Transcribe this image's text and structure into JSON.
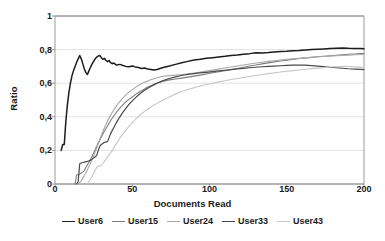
{
  "chart_data": {
    "type": "line",
    "title": "",
    "xlabel": "Documents Read",
    "ylabel": "Ratio",
    "xlim": [
      0,
      200
    ],
    "ylim": [
      0,
      1
    ],
    "xticks": [
      "0",
      "50",
      "100",
      "150",
      "200"
    ],
    "xtick_values": [
      0,
      50,
      100,
      150,
      200
    ],
    "yticks": [
      "0",
      "0,2",
      "0,4",
      "0,6",
      "0,8",
      "1"
    ],
    "ytick_values": [
      0,
      0.2,
      0.4,
      0.6,
      0.8,
      1
    ],
    "grid": "horizontal",
    "legend_position": "bottom",
    "decimal_separator": ",",
    "series": [
      {
        "name": "User6",
        "color": "#1c1c1c",
        "width": 1.5,
        "x": [
          4,
          5,
          6,
          7,
          8,
          9,
          10,
          11,
          12,
          13,
          14,
          15,
          16,
          17,
          18,
          19,
          20,
          21,
          22,
          23,
          24,
          25,
          26,
          27,
          28,
          29,
          30,
          31,
          32,
          33,
          34,
          35,
          36,
          37,
          38,
          39,
          40,
          42,
          44,
          46,
          48,
          50,
          52,
          54,
          56,
          58,
          60,
          62,
          64,
          66,
          68,
          70,
          74,
          78,
          82,
          86,
          90,
          94,
          98,
          102,
          106,
          110,
          114,
          118,
          122,
          126,
          130,
          134,
          138,
          142,
          146,
          150,
          154,
          158,
          162,
          166,
          170,
          174,
          178,
          182,
          186,
          190,
          194,
          198,
          200
        ],
        "y": [
          0.2,
          0.235,
          0.235,
          0.37,
          0.47,
          0.545,
          0.6,
          0.645,
          0.675,
          0.7,
          0.725,
          0.745,
          0.765,
          0.745,
          0.715,
          0.685,
          0.663,
          0.652,
          0.675,
          0.695,
          0.715,
          0.73,
          0.745,
          0.755,
          0.762,
          0.765,
          0.752,
          0.742,
          0.748,
          0.735,
          0.728,
          0.735,
          0.722,
          0.716,
          0.72,
          0.713,
          0.708,
          0.712,
          0.705,
          0.7,
          0.698,
          0.702,
          0.697,
          0.693,
          0.688,
          0.69,
          0.685,
          0.682,
          0.678,
          0.682,
          0.688,
          0.693,
          0.702,
          0.712,
          0.722,
          0.73,
          0.738,
          0.742,
          0.748,
          0.752,
          0.756,
          0.76,
          0.765,
          0.768,
          0.772,
          0.776,
          0.781,
          0.78,
          0.782,
          0.785,
          0.788,
          0.79,
          0.793,
          0.795,
          0.798,
          0.8,
          0.802,
          0.804,
          0.806,
          0.808,
          0.81,
          0.808,
          0.807,
          0.806,
          0.805
        ]
      },
      {
        "name": "User15",
        "color": "#7d7d7d",
        "width": 1.1,
        "x": [
          13,
          14,
          15,
          16,
          17,
          18,
          19,
          20,
          21,
          22,
          23,
          24,
          25,
          26,
          27,
          28,
          29,
          30,
          32,
          34,
          36,
          38,
          40,
          42,
          44,
          46,
          48,
          50,
          52,
          54,
          56,
          58,
          60,
          62,
          64,
          66,
          68,
          70,
          74,
          78,
          82,
          86,
          90,
          94,
          98,
          102,
          106,
          110,
          114,
          118,
          122,
          126,
          130,
          134,
          138,
          142,
          146,
          150,
          154,
          158,
          162,
          166,
          170,
          174,
          178,
          182,
          186,
          190,
          194,
          198,
          200
        ],
        "y": [
          0.0,
          0.055,
          0.055,
          0.06,
          0.065,
          0.072,
          0.08,
          0.1,
          0.115,
          0.128,
          0.145,
          0.165,
          0.185,
          0.205,
          0.225,
          0.245,
          0.262,
          0.28,
          0.315,
          0.345,
          0.378,
          0.405,
          0.43,
          0.452,
          0.472,
          0.49,
          0.505,
          0.518,
          0.532,
          0.545,
          0.555,
          0.566,
          0.577,
          0.585,
          0.593,
          0.6,
          0.606,
          0.612,
          0.62,
          0.625,
          0.63,
          0.636,
          0.642,
          0.648,
          0.655,
          0.662,
          0.668,
          0.675,
          0.682,
          0.688,
          0.695,
          0.702,
          0.708,
          0.715,
          0.721,
          0.727,
          0.732,
          0.737,
          0.742,
          0.747,
          0.751,
          0.754,
          0.757,
          0.76,
          0.763,
          0.766,
          0.769,
          0.772,
          0.774,
          0.776,
          0.777
        ]
      },
      {
        "name": "User24",
        "color": "#a8a8a8",
        "width": 1.1,
        "x": [
          15,
          16,
          17,
          18,
          19,
          20,
          21,
          22,
          23,
          24,
          25,
          26,
          27,
          28,
          29,
          30,
          32,
          34,
          36,
          38,
          40,
          42,
          44,
          46,
          48,
          50,
          52,
          54,
          56,
          58,
          60,
          62,
          64,
          66,
          68,
          70,
          74,
          78,
          82,
          86,
          90,
          94,
          98,
          102,
          106,
          110,
          114,
          118,
          122,
          126,
          130,
          134,
          138,
          142,
          146,
          150,
          154,
          158,
          162,
          166,
          170,
          174,
          178,
          182,
          186,
          190,
          194,
          198,
          200
        ],
        "y": [
          0.0,
          0.01,
          0.02,
          0.035,
          0.05,
          0.068,
          0.085,
          0.105,
          0.125,
          0.145,
          0.168,
          0.19,
          0.215,
          0.24,
          0.265,
          0.29,
          0.335,
          0.375,
          0.41,
          0.44,
          0.468,
          0.492,
          0.513,
          0.532,
          0.548,
          0.562,
          0.575,
          0.586,
          0.597,
          0.605,
          0.613,
          0.62,
          0.627,
          0.632,
          0.637,
          0.641,
          0.645,
          0.648,
          0.652,
          0.656,
          0.661,
          0.666,
          0.672,
          0.678,
          0.684,
          0.69,
          0.696,
          0.702,
          0.708,
          0.714,
          0.72,
          0.725,
          0.73,
          0.734,
          0.738,
          0.742,
          0.745,
          0.748,
          0.751,
          0.754,
          0.757,
          0.759,
          0.761,
          0.763,
          0.765,
          0.767,
          0.769,
          0.771,
          0.772
        ]
      },
      {
        "name": "User33",
        "color": "#4a4a4a",
        "width": 1.2,
        "x": [
          14,
          15,
          16,
          17,
          18,
          19,
          20,
          21,
          22,
          23,
          24,
          25,
          26,
          27,
          28,
          29,
          30,
          32,
          34,
          36,
          38,
          40,
          42,
          44,
          46,
          48,
          50,
          52,
          54,
          56,
          58,
          60,
          62,
          64,
          66,
          68,
          70,
          74,
          78,
          82,
          86,
          90,
          94,
          98,
          102,
          106,
          110,
          114,
          118,
          122,
          126,
          130,
          134,
          138,
          142,
          146,
          150,
          154,
          158,
          162,
          166,
          170,
          174,
          178,
          182,
          186,
          190,
          194,
          198,
          200
        ],
        "y": [
          0.0,
          0.015,
          0.12,
          0.125,
          0.128,
          0.13,
          0.133,
          0.135,
          0.138,
          0.142,
          0.148,
          0.155,
          0.162,
          0.17,
          0.2,
          0.225,
          0.235,
          0.248,
          0.252,
          0.3,
          0.335,
          0.37,
          0.4,
          0.428,
          0.452,
          0.475,
          0.495,
          0.513,
          0.53,
          0.545,
          0.558,
          0.57,
          0.58,
          0.59,
          0.6,
          0.608,
          0.615,
          0.628,
          0.638,
          0.646,
          0.652,
          0.657,
          0.661,
          0.665,
          0.669,
          0.673,
          0.677,
          0.681,
          0.685,
          0.688,
          0.692,
          0.695,
          0.698,
          0.7,
          0.702,
          0.704,
          0.706,
          0.707,
          0.708,
          0.707,
          0.705,
          0.702,
          0.699,
          0.695,
          0.692,
          0.689,
          0.686,
          0.684,
          0.682,
          0.681
        ]
      },
      {
        "name": "User43",
        "color": "#c6c6c6",
        "width": 1.1,
        "x": [
          21,
          22,
          23,
          24,
          25,
          26,
          27,
          28,
          29,
          30,
          32,
          34,
          36,
          38,
          40,
          42,
          44,
          46,
          48,
          50,
          52,
          54,
          56,
          58,
          60,
          62,
          64,
          66,
          68,
          70,
          74,
          78,
          82,
          86,
          90,
          94,
          98,
          102,
          106,
          110,
          114,
          118,
          122,
          126,
          130,
          134,
          138,
          142,
          146,
          150,
          154,
          158,
          162,
          166,
          170,
          174,
          178,
          182,
          186,
          190,
          194,
          198,
          200
        ],
        "y": [
          0.0,
          0.015,
          0.03,
          0.045,
          0.062,
          0.08,
          0.098,
          0.105,
          0.108,
          0.11,
          0.135,
          0.16,
          0.185,
          0.215,
          0.245,
          0.272,
          0.298,
          0.322,
          0.345,
          0.365,
          0.385,
          0.402,
          0.418,
          0.432,
          0.445,
          0.458,
          0.47,
          0.48,
          0.49,
          0.5,
          0.518,
          0.535,
          0.55,
          0.562,
          0.573,
          0.583,
          0.592,
          0.6,
          0.608,
          0.615,
          0.622,
          0.628,
          0.634,
          0.64,
          0.646,
          0.652,
          0.657,
          0.662,
          0.667,
          0.671,
          0.675,
          0.679,
          0.683,
          0.687,
          0.69,
          0.693,
          0.696,
          0.698,
          0.7,
          0.699,
          0.697,
          0.694,
          0.692
        ]
      }
    ],
    "legend": [
      "User6",
      "User15",
      "User24",
      "User33",
      "User43"
    ]
  },
  "style": {
    "axis_color": "#9a9a9a",
    "grid_color": "#e2e2e2",
    "text_color": "#1a1a1a",
    "background": "#ffffff"
  }
}
